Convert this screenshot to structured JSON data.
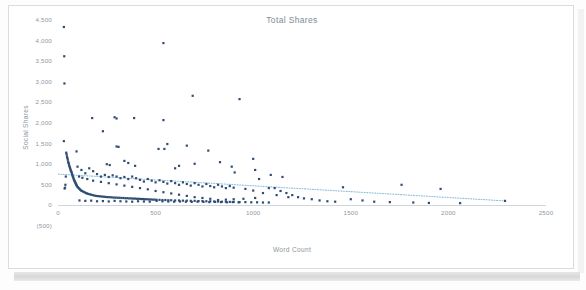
{
  "chart_data": {
    "type": "scatter",
    "title": "Total Shares",
    "xlabel": "Word Count",
    "ylabel": "Social Shares",
    "xlim": [
      0,
      2500
    ],
    "ylim": [
      -500,
      4500
    ],
    "grid": false,
    "legend": "none",
    "x_ticks": [
      "0",
      "500",
      "1000",
      "1500",
      "2000",
      "2500"
    ],
    "x_tick_values": [
      0,
      500,
      1000,
      1500,
      2000,
      2500
    ],
    "y_ticks": [
      "(500)",
      "0",
      "500",
      "1,000",
      "1,500",
      "2,000",
      "2,500",
      "3,000",
      "3,500",
      "4,000",
      "4,500"
    ],
    "y_tick_values": [
      -500,
      0,
      500,
      1000,
      1500,
      2000,
      2500,
      3000,
      3500,
      4000,
      4500
    ],
    "marker_color": "#2f4d73",
    "trendline_color": "#8fc0dd",
    "trendline_style": "dotted",
    "trendline": {
      "x_start": 0,
      "y_start": 760,
      "x_end": 2290,
      "y_end": 110
    },
    "series": [
      {
        "name": "Social Shares",
        "points": [
          [
            30,
            4330
          ],
          [
            32,
            3620
          ],
          [
            33,
            2960
          ],
          [
            540,
            3940
          ],
          [
            690,
            2660
          ],
          [
            930,
            2580
          ],
          [
            175,
            2120
          ],
          [
            290,
            2140
          ],
          [
            300,
            2110
          ],
          [
            390,
            2120
          ],
          [
            540,
            2070
          ],
          [
            230,
            1800
          ],
          [
            30,
            1560
          ],
          [
            560,
            1490
          ],
          [
            660,
            1450
          ],
          [
            300,
            1430
          ],
          [
            310,
            1420
          ],
          [
            515,
            1370
          ],
          [
            545,
            1370
          ],
          [
            770,
            1330
          ],
          [
            95,
            1310
          ],
          [
            1000,
            1130
          ],
          [
            830,
            1050
          ],
          [
            46,
            1190
          ],
          [
            48,
            1150
          ],
          [
            50,
            1110
          ],
          [
            52,
            1060
          ],
          [
            54,
            1030
          ],
          [
            56,
            1000
          ],
          [
            340,
            1080
          ],
          [
            360,
            1030
          ],
          [
            250,
            1000
          ],
          [
            265,
            980
          ],
          [
            395,
            960
          ],
          [
            700,
            1010
          ],
          [
            890,
            940
          ],
          [
            905,
            800
          ],
          [
            1010,
            860
          ],
          [
            620,
            960
          ],
          [
            600,
            900
          ],
          [
            58,
            960
          ],
          [
            60,
            930
          ],
          [
            62,
            900
          ],
          [
            64,
            870
          ],
          [
            66,
            840
          ],
          [
            68,
            820
          ],
          [
            70,
            800
          ],
          [
            100,
            940
          ],
          [
            120,
            860
          ],
          [
            140,
            780
          ],
          [
            160,
            900
          ],
          [
            180,
            830
          ],
          [
            200,
            760
          ],
          [
            220,
            700
          ],
          [
            240,
            740
          ],
          [
            260,
            690
          ],
          [
            280,
            730
          ],
          [
            300,
            700
          ],
          [
            320,
            660
          ],
          [
            340,
            690
          ],
          [
            360,
            640
          ],
          [
            380,
            700
          ],
          [
            400,
            660
          ],
          [
            420,
            620
          ],
          [
            440,
            580
          ],
          [
            460,
            640
          ],
          [
            480,
            600
          ],
          [
            500,
            560
          ],
          [
            520,
            610
          ],
          [
            540,
            570
          ],
          [
            560,
            530
          ],
          [
            580,
            590
          ],
          [
            600,
            540
          ],
          [
            620,
            500
          ],
          [
            640,
            560
          ],
          [
            660,
            520
          ],
          [
            680,
            480
          ],
          [
            700,
            540
          ],
          [
            720,
            500
          ],
          [
            740,
            460
          ],
          [
            760,
            520
          ],
          [
            780,
            470
          ],
          [
            800,
            440
          ],
          [
            820,
            500
          ],
          [
            840,
            460
          ],
          [
            860,
            420
          ],
          [
            880,
            470
          ],
          [
            900,
            430
          ],
          [
            72,
            760
          ],
          [
            74,
            730
          ],
          [
            76,
            700
          ],
          [
            78,
            680
          ],
          [
            80,
            650
          ],
          [
            82,
            620
          ],
          [
            84,
            600
          ],
          [
            86,
            580
          ],
          [
            88,
            560
          ],
          [
            90,
            540
          ],
          [
            92,
            520
          ],
          [
            94,
            500
          ],
          [
            96,
            480
          ],
          [
            98,
            460
          ],
          [
            102,
            440
          ],
          [
            106,
            420
          ],
          [
            110,
            400
          ],
          [
            114,
            380
          ],
          [
            118,
            360
          ],
          [
            124,
            350
          ],
          [
            130,
            330
          ],
          [
            136,
            320
          ],
          [
            142,
            300
          ],
          [
            148,
            290
          ],
          [
            155,
            280
          ],
          [
            162,
            270
          ],
          [
            170,
            260
          ],
          [
            178,
            250
          ],
          [
            186,
            240
          ],
          [
            195,
            230
          ],
          [
            205,
            225
          ],
          [
            215,
            220
          ],
          [
            225,
            215
          ],
          [
            235,
            210
          ],
          [
            245,
            205
          ],
          [
            255,
            200
          ],
          [
            265,
            200
          ],
          [
            275,
            195
          ],
          [
            285,
            190
          ],
          [
            295,
            190
          ],
          [
            305,
            185
          ],
          [
            315,
            185
          ],
          [
            325,
            180
          ],
          [
            335,
            180
          ],
          [
            345,
            175
          ],
          [
            355,
            175
          ],
          [
            365,
            170
          ],
          [
            375,
            170
          ],
          [
            385,
            165
          ],
          [
            395,
            165
          ],
          [
            405,
            160
          ],
          [
            415,
            160
          ],
          [
            425,
            155
          ],
          [
            435,
            155
          ],
          [
            445,
            150
          ],
          [
            455,
            150
          ],
          [
            465,
            145
          ],
          [
            475,
            145
          ],
          [
            485,
            140
          ],
          [
            495,
            140
          ],
          [
            505,
            135
          ],
          [
            520,
            135
          ],
          [
            535,
            130
          ],
          [
            550,
            130
          ],
          [
            565,
            125
          ],
          [
            580,
            125
          ],
          [
            600,
            120
          ],
          [
            620,
            120
          ],
          [
            640,
            115
          ],
          [
            660,
            115
          ],
          [
            680,
            110
          ],
          [
            700,
            110
          ],
          [
            720,
            105
          ],
          [
            740,
            105
          ],
          [
            760,
            100
          ],
          [
            780,
            100
          ],
          [
            800,
            95
          ],
          [
            820,
            95
          ],
          [
            840,
            90
          ],
          [
            860,
            90
          ],
          [
            880,
            85
          ],
          [
            900,
            85
          ],
          [
            930,
            80
          ],
          [
            960,
            80
          ],
          [
            990,
            75
          ],
          [
            1020,
            75
          ],
          [
            1050,
            70
          ],
          [
            1080,
            70
          ],
          [
            1110,
            420
          ],
          [
            1140,
            350
          ],
          [
            1170,
            300
          ],
          [
            1200,
            250
          ],
          [
            1230,
            200
          ],
          [
            1260,
            170
          ],
          [
            1300,
            150
          ],
          [
            1340,
            120
          ],
          [
            1380,
            100
          ],
          [
            1420,
            90
          ],
          [
            1460,
            440
          ],
          [
            1500,
            150
          ],
          [
            1560,
            120
          ],
          [
            1620,
            90
          ],
          [
            1700,
            80
          ],
          [
            1760,
            500
          ],
          [
            1820,
            70
          ],
          [
            1900,
            60
          ],
          [
            1960,
            400
          ],
          [
            2060,
            55
          ],
          [
            2290,
            110
          ],
          [
            1030,
            640
          ],
          [
            1090,
            740
          ],
          [
            1150,
            690
          ],
          [
            1080,
            420
          ],
          [
            1050,
            300
          ],
          [
            1120,
            250
          ],
          [
            1180,
            200
          ],
          [
            1000,
            360
          ],
          [
            960,
            400
          ],
          [
            1010,
            180
          ],
          [
            950,
            160
          ],
          [
            900,
            150
          ],
          [
            860,
            140
          ],
          [
            820,
            130
          ],
          [
            780,
            160
          ],
          [
            740,
            180
          ],
          [
            700,
            200
          ],
          [
            660,
            230
          ],
          [
            620,
            260
          ],
          [
            580,
            290
          ],
          [
            540,
            320
          ],
          [
            500,
            350
          ],
          [
            460,
            390
          ],
          [
            420,
            420
          ],
          [
            380,
            450
          ],
          [
            340,
            480
          ],
          [
            300,
            510
          ],
          [
            260,
            540
          ],
          [
            220,
            570
          ],
          [
            180,
            600
          ],
          [
            150,
            640
          ],
          [
            125,
            670
          ],
          [
            108,
            700
          ],
          [
            44,
            1240
          ],
          [
            42,
            1280
          ],
          [
            40,
            700
          ],
          [
            38,
            500
          ],
          [
            36,
            430
          ],
          [
            34,
            410
          ],
          [
            110,
            120
          ],
          [
            140,
            110
          ],
          [
            170,
            115
          ],
          [
            200,
            100
          ],
          [
            230,
            105
          ],
          [
            260,
            95
          ],
          [
            290,
            110
          ],
          [
            320,
            100
          ],
          [
            350,
            95
          ],
          [
            380,
            90
          ],
          [
            410,
            100
          ],
          [
            440,
            95
          ],
          [
            470,
            90
          ],
          [
            505,
            110
          ],
          [
            535,
            100
          ],
          [
            565,
            95
          ],
          [
            595,
            90
          ],
          [
            625,
            95
          ],
          [
            655,
            90
          ],
          [
            685,
            85
          ],
          [
            715,
            90
          ],
          [
            745,
            85
          ],
          [
            775,
            80
          ],
          [
            805,
            85
          ],
          [
            835,
            80
          ],
          [
            865,
            75
          ],
          [
            895,
            80
          ],
          [
            925,
            75
          ]
        ]
      }
    ]
  },
  "panel": {
    "background": "#ffffff",
    "border_color": "#d9dde1"
  }
}
